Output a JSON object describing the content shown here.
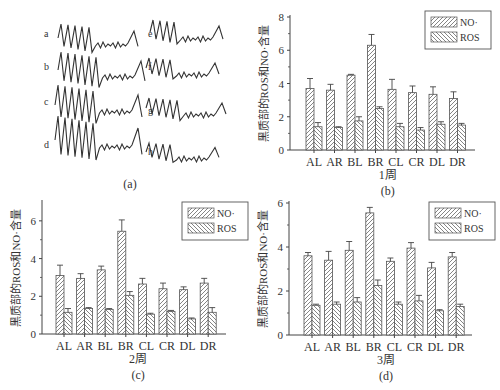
{
  "panel_a": {
    "caption": "(a)",
    "trace_labels": [
      "a",
      "b",
      "c",
      "d",
      "e",
      "f",
      "g",
      "h"
    ]
  },
  "colors": {
    "axis": "#444444",
    "bar_stroke": "#555555",
    "hatch": "#666666",
    "background": "#ffffff"
  },
  "chart_data": [
    {
      "id": "b",
      "type": "bar",
      "caption": "(b)",
      "xlabel": "1周",
      "ylabel": "黑质部的ROS和NO·含量",
      "categories": [
        "AL",
        "AR",
        "BL",
        "BR",
        "CL",
        "CR",
        "DL",
        "DR"
      ],
      "ylim": [
        0,
        8
      ],
      "yticks": [
        0,
        2,
        4,
        6,
        8
      ],
      "legend": [
        "NO·",
        "ROS"
      ],
      "legend_position": "top-right",
      "grid": false,
      "series": [
        {
          "name": "NO·",
          "values": [
            3.7,
            3.6,
            4.5,
            6.3,
            3.65,
            3.45,
            3.35,
            3.1
          ],
          "errors": [
            0.6,
            0.35,
            0.05,
            0.65,
            0.6,
            0.4,
            0.45,
            0.4
          ]
        },
        {
          "name": "ROS",
          "values": [
            1.4,
            1.35,
            1.75,
            2.5,
            1.4,
            1.2,
            1.55,
            1.5
          ],
          "errors": [
            0.25,
            0.05,
            0.25,
            0.1,
            0.2,
            0.15,
            0.15,
            0.1
          ]
        }
      ]
    },
    {
      "id": "c",
      "type": "bar",
      "caption": "(c)",
      "xlabel": "2周",
      "ylabel": "黑质部的ROS和NO·含量",
      "categories": [
        "AL",
        "AR",
        "BL",
        "BR",
        "CL",
        "CR",
        "DL",
        "DR"
      ],
      "ylim": [
        0,
        7
      ],
      "yticks": [
        0,
        2,
        4,
        6
      ],
      "legend": [
        "NO·",
        "ROS"
      ],
      "legend_position": "top-right",
      "grid": false,
      "series": [
        {
          "name": "NO·",
          "values": [
            3.1,
            2.95,
            3.4,
            5.45,
            2.65,
            2.4,
            2.35,
            2.7
          ],
          "errors": [
            0.55,
            0.25,
            0.2,
            0.6,
            0.3,
            0.3,
            0.15,
            0.25
          ]
        },
        {
          "name": "ROS",
          "values": [
            1.15,
            1.35,
            1.3,
            2.05,
            1.05,
            1.2,
            0.8,
            1.15
          ],
          "errors": [
            0.2,
            0.05,
            0.05,
            0.2,
            0.05,
            0.05,
            0.05,
            0.25
          ]
        }
      ]
    },
    {
      "id": "d",
      "type": "bar",
      "caption": "(d)",
      "xlabel": "3周",
      "ylabel": "黑质部的ROS和NO·含量",
      "categories": [
        "AL",
        "AR",
        "BL",
        "BR",
        "CL",
        "CR",
        "DL",
        "DR"
      ],
      "ylim": [
        0,
        6
      ],
      "yticks": [
        0,
        2,
        4,
        6
      ],
      "legend": [
        "NO·",
        "ROS"
      ],
      "legend_position": "top-right",
      "grid": false,
      "series": [
        {
          "name": "NO·",
          "values": [
            3.6,
            3.4,
            3.85,
            5.55,
            3.35,
            3.95,
            3.05,
            3.55
          ],
          "errors": [
            0.15,
            0.4,
            0.4,
            0.25,
            0.15,
            0.25,
            0.25,
            0.2
          ]
        },
        {
          "name": "ROS",
          "values": [
            1.35,
            1.4,
            1.5,
            2.25,
            1.4,
            1.55,
            1.1,
            1.3
          ],
          "errors": [
            0.05,
            0.1,
            0.2,
            0.25,
            0.1,
            0.25,
            0.05,
            0.1
          ]
        }
      ]
    }
  ]
}
